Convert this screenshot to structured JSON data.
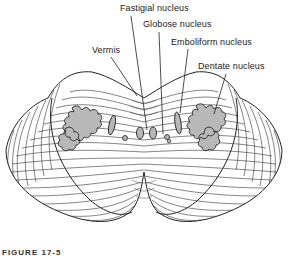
{
  "figure": {
    "caption": "FIGURE 17-5",
    "labels": [
      {
        "id": "fastigial",
        "text": "Fastigial nucleus",
        "x": 120,
        "y": 3
      },
      {
        "id": "globose",
        "text": "Globose nucleus",
        "x": 143,
        "y": 19
      },
      {
        "id": "emboliform",
        "text": "Emboliform nucleus",
        "x": 171,
        "y": 37
      },
      {
        "id": "dentate",
        "text": "Dentate nucleus",
        "x": 198,
        "y": 61
      },
      {
        "id": "vermis",
        "text": "Vermis",
        "x": 92,
        "y": 45
      }
    ],
    "colors": {
      "line": "#222222",
      "nucleus_fill": "#b8b8b8",
      "background": "#ffffff"
    }
  }
}
